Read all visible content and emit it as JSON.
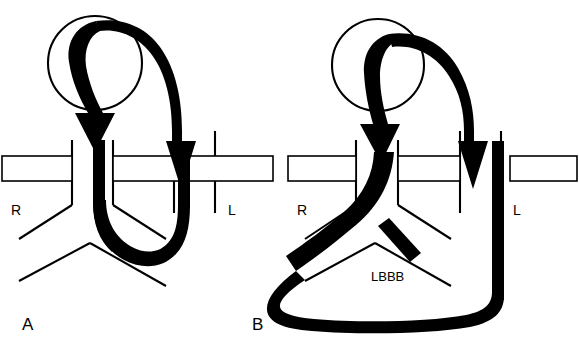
{
  "figure": {
    "background_color": "#ffffff",
    "ink_color": "#000000",
    "panels": [
      {
        "id": "A",
        "label": "A",
        "label_x": 22,
        "label_y": 330,
        "description": "Normal reciprocal beat circuit",
        "node_circle": {
          "cx": 95,
          "cy": 63,
          "r": 47
        },
        "septum_bands": [
          {
            "x": 2,
            "y": 156,
            "width": 70,
            "height": 25
          },
          {
            "x": 113,
            "y": 156,
            "width": 160,
            "height": 25
          }
        ],
        "chamber_labels": [
          {
            "text": "R",
            "x": 11,
            "y": 215
          },
          {
            "text": "L",
            "x": 228,
            "y": 215
          }
        ],
        "wall_lines": [
          {
            "x1": 72,
            "y1": 140,
            "x2": 72,
            "y2": 205
          },
          {
            "x1": 113,
            "y1": 140,
            "x2": 113,
            "y2": 205
          },
          {
            "x1": 174,
            "y1": 131,
            "x2": 174,
            "y2": 213
          },
          {
            "x1": 215,
            "y1": 131,
            "x2": 215,
            "y2": 213
          },
          {
            "x1": 19,
            "y1": 239,
            "x2": 72,
            "y2": 205
          },
          {
            "x1": 113,
            "y1": 205,
            "x2": 166,
            "y2": 239
          },
          {
            "x1": 19,
            "y1": 281,
            "x2": 90,
            "y2": 243
          },
          {
            "x1": 90,
            "y1": 243,
            "x2": 166,
            "y2": 286
          }
        ]
      },
      {
        "id": "B",
        "label": "B",
        "label_x": 252,
        "label_y": 330,
        "description": "Reciprocal beat with left bundle branch block",
        "node_circle": {
          "cx": 378,
          "cy": 65,
          "r": 46
        },
        "septum_bands": [
          {
            "x": 288,
            "y": 156,
            "width": 68,
            "height": 25
          },
          {
            "x": 398,
            "y": 156,
            "width": 62,
            "height": 25
          },
          {
            "x": 510,
            "y": 156,
            "width": 67,
            "height": 25
          }
        ],
        "chamber_labels": [
          {
            "text": "R",
            "x": 297,
            "y": 215
          },
          {
            "text": "L",
            "x": 513,
            "y": 215
          }
        ],
        "block_label": {
          "text": "LBBB",
          "x": 371,
          "y": 281
        },
        "block_bar": {
          "x1": 382,
          "y1": 231,
          "x2": 417,
          "y2": 258,
          "width": 10
        },
        "wall_lines": [
          {
            "x1": 356,
            "y1": 140,
            "x2": 356,
            "y2": 205
          },
          {
            "x1": 398,
            "y1": 140,
            "x2": 398,
            "y2": 205
          },
          {
            "x1": 460,
            "y1": 131,
            "x2": 460,
            "y2": 213
          },
          {
            "x1": 501,
            "y1": 131,
            "x2": 501,
            "y2": 213
          },
          {
            "x1": 305,
            "y1": 239,
            "x2": 356,
            "y2": 205
          },
          {
            "x1": 398,
            "y1": 205,
            "x2": 451,
            "y2": 239
          },
          {
            "x1": 305,
            "y1": 281,
            "x2": 375,
            "y2": 243
          },
          {
            "x1": 375,
            "y1": 243,
            "x2": 451,
            "y2": 286
          }
        ]
      }
    ],
    "arrows": [
      {
        "panel": "A",
        "name": "antegrade-down-arrow",
        "direction": "down"
      },
      {
        "panel": "A",
        "name": "retrograde-up-arrow",
        "direction": "up"
      },
      {
        "panel": "B",
        "name": "antegrade-down-arrow",
        "direction": "down"
      },
      {
        "panel": "B",
        "name": "retrograde-up-arrow",
        "direction": "up"
      }
    ]
  }
}
